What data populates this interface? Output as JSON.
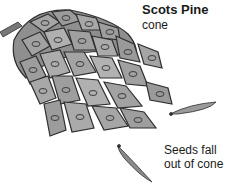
{
  "labels": {
    "title": "Scots Pine",
    "subtitle": "cone",
    "seeds_line1": "Seeds fall",
    "seeds_line2": "out of cone"
  },
  "colors": {
    "scale_fill": "#9a9a9a",
    "scale_dark": "#3a3a3a",
    "seed_fill": "#8a8a8a",
    "text": "#1a1a1a"
  }
}
